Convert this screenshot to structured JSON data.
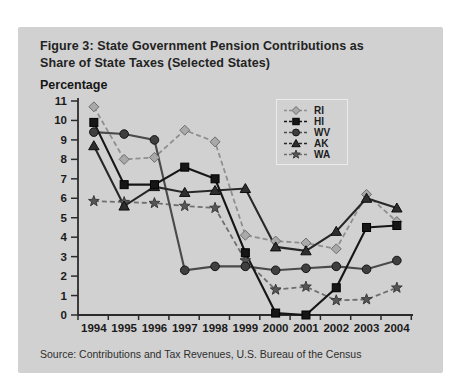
{
  "figure": {
    "title_line1": "Figure 3: State Government Pension Contributions as",
    "title_line2": "Share of State Taxes (Selected States)",
    "y_axis_label": "Percentage",
    "source": "Source: Contributions and Tax Revenues, U.S. Bureau of the Census"
  },
  "chart_data": {
    "type": "line",
    "x": [
      1994,
      1995,
      1996,
      1997,
      1998,
      1999,
      2000,
      2001,
      2002,
      2003,
      2004
    ],
    "series": [
      {
        "name": "RI",
        "marker": "diamond",
        "line_style": "dashed",
        "color": "#8f8f8f",
        "marker_fill": "#a9a9a9",
        "marker_stroke": "#6e6e6e",
        "values": [
          10.7,
          8.0,
          8.1,
          9.5,
          8.9,
          4.1,
          3.8,
          3.7,
          3.4,
          6.2,
          4.8
        ]
      },
      {
        "name": "HI",
        "marker": "square",
        "line_style": "solid",
        "color": "#161616",
        "marker_fill": "#161616",
        "marker_stroke": "#000000",
        "values": [
          9.9,
          6.7,
          6.7,
          7.6,
          7.0,
          3.2,
          0.1,
          0.0,
          1.4,
          4.5,
          4.6
        ]
      },
      {
        "name": "WV",
        "marker": "circle",
        "line_style": "solid",
        "color": "#4a4a4a",
        "marker_fill": "#3f3f3f",
        "marker_stroke": "#141414",
        "values": [
          9.4,
          9.3,
          9.0,
          2.3,
          2.5,
          2.5,
          2.3,
          2.4,
          2.5,
          2.35,
          2.8
        ]
      },
      {
        "name": "AK",
        "marker": "triangle",
        "line_style": "solid",
        "color": "#282828",
        "marker_fill": "#2e2e2e",
        "marker_stroke": "#0d0d0d",
        "values": [
          8.7,
          5.6,
          6.6,
          6.3,
          6.4,
          6.5,
          3.5,
          3.3,
          4.3,
          6.0,
          5.5
        ]
      },
      {
        "name": "WA",
        "marker": "star",
        "line_style": "dashed",
        "color": "#6f6f6f",
        "marker_fill": "#565656",
        "marker_stroke": "#3a3a3a",
        "values": [
          5.85,
          5.8,
          5.75,
          5.6,
          5.5,
          2.8,
          1.3,
          1.45,
          0.75,
          0.8,
          1.4
        ]
      }
    ],
    "title": "Figure 3: State Government Pension Contributions as Share of State Taxes (Selected States)",
    "xlabel": "",
    "ylabel": "Percentage",
    "ylim": [
      0,
      11
    ],
    "yticks": [
      0,
      1,
      2,
      3,
      4,
      5,
      6,
      7,
      8,
      9,
      10,
      11
    ],
    "grid": false,
    "legend_position": "top-right"
  },
  "colors": {
    "page_bg": "#ffffff",
    "panel_bg": "#d1d1d1",
    "axis": "#2b2b2b",
    "text": "#1b1b1b"
  }
}
